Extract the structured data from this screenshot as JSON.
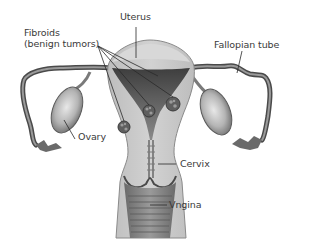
{
  "diagram": {
    "labels": {
      "uterus": "Uterus",
      "fibroids_line1": "Fibroids",
      "fibroids_line2": "(benign tumors)",
      "fallopian_tube": "Fallopian tube",
      "ovary": "Ovary",
      "cervix": "Cervix",
      "vagina": "Vngina"
    },
    "colors": {
      "tissue_light": "#c9c9c9",
      "tissue_mid": "#a9a9a9",
      "tissue_dark": "#5a5a5a",
      "cavity": "#7a7a7a",
      "line": "#2a2a2a",
      "text": "#3a3a3a",
      "background": "#ffffff"
    },
    "fibroid_count": 4
  }
}
